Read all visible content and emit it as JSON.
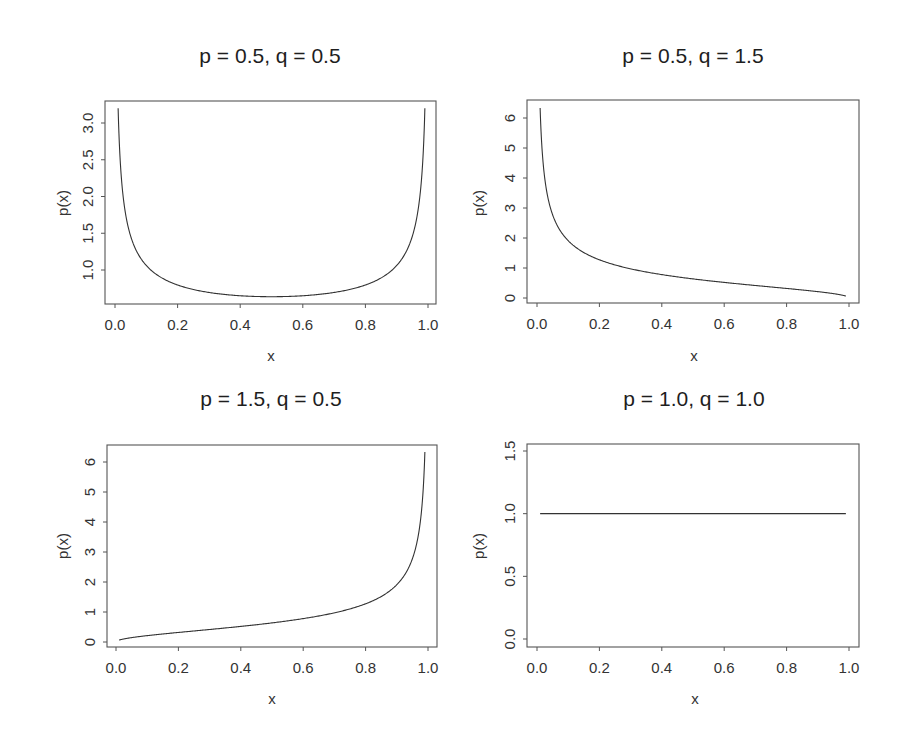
{
  "chart_data": [
    {
      "type": "line",
      "title": "p = 0.5, q = 0.5",
      "xlabel": "x",
      "ylabel": "p(x)",
      "xlim": [
        0,
        1
      ],
      "ylim": [
        0.6,
        3.25
      ],
      "x_ticks": [
        "0.0",
        "0.2",
        "0.4",
        "0.6",
        "0.8",
        "1.0"
      ],
      "y_ticks": [
        "1.0",
        "1.5",
        "2.0",
        "2.5",
        "3.0"
      ],
      "grid": false,
      "series": [
        {
          "name": "Beta(0.5, 0.5) density",
          "x": [
            0.01,
            0.05,
            0.1,
            0.2,
            0.3,
            0.4,
            0.5,
            0.6,
            0.7,
            0.8,
            0.9,
            0.95,
            0.99
          ],
          "y": [
            3.2,
            1.46,
            1.06,
            0.8,
            0.69,
            0.65,
            0.64,
            0.65,
            0.69,
            0.8,
            1.06,
            1.46,
            3.2
          ]
        }
      ],
      "params": {
        "p": 0.5,
        "q": 0.5
      }
    },
    {
      "type": "line",
      "title": "p = 0.5, q = 1.5",
      "xlabel": "x",
      "ylabel": "p(x)",
      "xlim": [
        0,
        1
      ],
      "ylim": [
        -0.2,
        6.6
      ],
      "x_ticks": [
        "0.0",
        "0.2",
        "0.4",
        "0.6",
        "0.8",
        "1.0"
      ],
      "y_ticks": [
        "0",
        "1",
        "2",
        "3",
        "4",
        "5",
        "6"
      ],
      "grid": false,
      "series": [
        {
          "name": "Beta(0.5, 1.5) density",
          "x": [
            0.01,
            0.05,
            0.1,
            0.2,
            0.3,
            0.4,
            0.5,
            0.6,
            0.7,
            0.8,
            0.9,
            0.95,
            0.99
          ],
          "y": [
            6.33,
            2.78,
            1.91,
            1.27,
            0.97,
            0.78,
            0.64,
            0.52,
            0.42,
            0.32,
            0.21,
            0.15,
            0.06
          ]
        }
      ],
      "params": {
        "p": 0.5,
        "q": 1.5
      }
    },
    {
      "type": "line",
      "title": "p = 1.5, q = 0.5",
      "xlabel": "x",
      "ylabel": "p(x)",
      "xlim": [
        0,
        1
      ],
      "ylim": [
        -0.2,
        6.6
      ],
      "x_ticks": [
        "0.0",
        "0.2",
        "0.4",
        "0.6",
        "0.8",
        "1.0"
      ],
      "y_ticks": [
        "0",
        "1",
        "2",
        "3",
        "4",
        "5",
        "6"
      ],
      "grid": false,
      "series": [
        {
          "name": "Beta(1.5, 0.5) density",
          "x": [
            0.01,
            0.05,
            0.1,
            0.2,
            0.3,
            0.4,
            0.5,
            0.6,
            0.7,
            0.8,
            0.9,
            0.95,
            0.99
          ],
          "y": [
            0.06,
            0.15,
            0.21,
            0.32,
            0.42,
            0.52,
            0.64,
            0.78,
            0.97,
            1.27,
            1.91,
            2.78,
            6.33
          ]
        }
      ],
      "params": {
        "p": 1.5,
        "q": 0.5
      }
    },
    {
      "type": "line",
      "title": "p = 1.0, q = 1.0",
      "xlabel": "x",
      "ylabel": "p(x)",
      "xlim": [
        0,
        1
      ],
      "ylim": [
        -0.05,
        1.55
      ],
      "x_ticks": [
        "0.0",
        "0.2",
        "0.4",
        "0.6",
        "0.8",
        "1.0"
      ],
      "y_ticks": [
        "0.0",
        "0.5",
        "1.0",
        "1.5"
      ],
      "grid": false,
      "series": [
        {
          "name": "Beta(1.0, 1.0) density",
          "x": [
            0.01,
            0.99
          ],
          "y": [
            1.0,
            1.0
          ]
        }
      ],
      "params": {
        "p": 1.0,
        "q": 1.0
      }
    }
  ],
  "panels": [
    {
      "title": "p = 0.5, q = 0.5",
      "xlabel": "x",
      "ylabel": "p(x)"
    },
    {
      "title": "p = 0.5, q = 1.5",
      "xlabel": "x",
      "ylabel": "p(x)"
    },
    {
      "title": "p = 1.5, q = 0.5",
      "xlabel": "x",
      "ylabel": "p(x)"
    },
    {
      "title": "p = 1.0, q = 1.0",
      "xlabel": "x",
      "ylabel": "p(x)"
    }
  ],
  "style": {
    "line_color": "#333333",
    "axis_color": "#555555",
    "text_color": "#333333"
  }
}
